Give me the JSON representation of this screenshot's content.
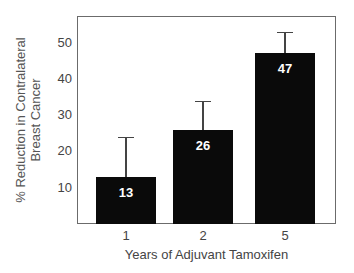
{
  "chart_data": {
    "type": "bar",
    "title": "",
    "xlabel": "Years of Adjuvant Tamoxifen",
    "ylabel": "% Reduction in Contralateral Breast Cancer",
    "ylabel_lines": [
      "% Reduction in Contralateral",
      "Breast Cancer"
    ],
    "categories": [
      "1",
      "2",
      "5"
    ],
    "values": [
      13,
      26,
      47
    ],
    "error_upper": [
      24,
      34,
      53
    ],
    "data_labels": [
      "13",
      "26",
      "47"
    ],
    "yticks": [
      10,
      20,
      30,
      40,
      50
    ],
    "ylim": [
      0,
      57
    ],
    "grid": false,
    "legend": null,
    "bar_color": "#0a0a0a",
    "label_color": "#ffffff"
  }
}
